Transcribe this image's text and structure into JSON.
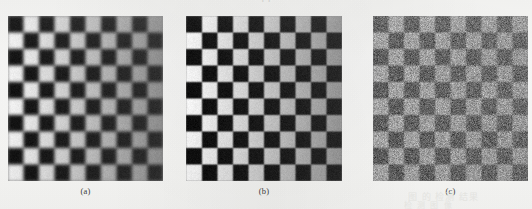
{
  "figure": {
    "kind": "scanned-book-figure",
    "panel_count": 3,
    "paper_color": "#fbfbfa",
    "top_cut_text": "( )",
    "ghost_text_1": "图 的 检测 结果",
    "ghost_text_2": "检 测 图 像",
    "ghost_text_3": "",
    "panels": [
      {
        "id": "a",
        "caption": "(a)",
        "description": "blurred checkerboard with left-to-right contrast falloff",
        "left": 8,
        "top": 16,
        "width": 155,
        "height": 165,
        "rows": 10,
        "cols": 10,
        "blur_px": 1.6,
        "noise_sigma": 6,
        "dark_left": "#121212",
        "light_left": "#f4f4f2",
        "dark_right": "#2e2e2e",
        "light_right": "#8d8d8d"
      },
      {
        "id": "b",
        "caption": "(b)",
        "description": "sharper restored checkerboard with same contrast falloff",
        "left": 186,
        "top": 16,
        "width": 156,
        "height": 165,
        "rows": 10,
        "cols": 10,
        "blur_px": 0.7,
        "noise_sigma": 7,
        "dark_left": "#0d0d0d",
        "light_left": "#f7f7f5",
        "dark_right": "#262626",
        "light_right": "#939393"
      },
      {
        "id": "c",
        "caption": "(c)",
        "description": "heavily noise-degraded low-contrast checkerboard",
        "left": 373,
        "top": 16,
        "width": 155,
        "height": 165,
        "rows": 10,
        "cols": 10,
        "blur_px": 0.9,
        "noise_sigma": 34,
        "dark_left": "#5d5d5d",
        "light_left": "#a6a6a6",
        "dark_right": "#6a6a6a",
        "light_right": "#989898"
      }
    ],
    "captions_row": {
      "top": 186,
      "font_size_px": 8.5
    }
  },
  "chart_data": {
    "type": "heatmap",
    "title": "",
    "xlabel": "",
    "ylabel": "",
    "grid": true,
    "legend": "none",
    "panels": [
      {
        "name": "(a)",
        "rows": 10,
        "cols": 10,
        "description": "Checkerboard test image, contrast decreasing left to right; mildly blurred.",
        "column_contrast": [
          1.0,
          0.95,
          0.88,
          0.79,
          0.68,
          0.56,
          0.45,
          0.35,
          0.27,
          0.22
        ],
        "dark_values": [
          18,
          20,
          23,
          26,
          30,
          34,
          38,
          42,
          45,
          46
        ],
        "light_values": [
          244,
          236,
          224,
          209,
          191,
          172,
          156,
          147,
          142,
          141
        ]
      },
      {
        "name": "(b)",
        "rows": 10,
        "cols": 10,
        "description": "Restored / deblurred checkerboard, same contrast ramp, sharper edges.",
        "column_contrast": [
          1.0,
          0.96,
          0.9,
          0.82,
          0.72,
          0.6,
          0.49,
          0.39,
          0.31,
          0.26
        ],
        "dark_values": [
          13,
          15,
          18,
          21,
          25,
          29,
          33,
          36,
          38,
          38
        ],
        "light_values": [
          247,
          240,
          229,
          215,
          198,
          180,
          163,
          154,
          148,
          147
        ]
      },
      {
        "name": "(c)",
        "rows": 10,
        "cols": 10,
        "description": "Noise-degraded observation; very low contrast with strong additive noise.",
        "column_contrast": [
          0.28,
          0.27,
          0.26,
          0.24,
          0.22,
          0.2,
          0.18,
          0.17,
          0.16,
          0.15
        ],
        "dark_values": [
          93,
          94,
          96,
          98,
          100,
          102,
          104,
          105,
          106,
          106
        ],
        "light_values": [
          166,
          164,
          161,
          158,
          155,
          152,
          150,
          149,
          148,
          148
        ],
        "noise_sigma": 34
      }
    ]
  }
}
